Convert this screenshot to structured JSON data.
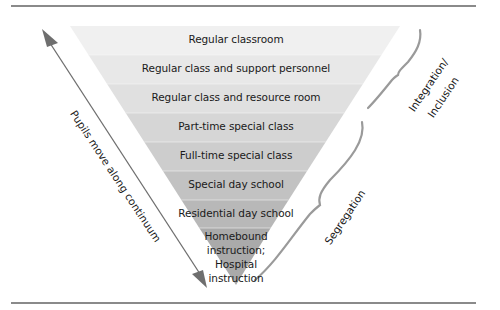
{
  "diagram": {
    "title": "",
    "bands": [
      {
        "label": "Regular classroom",
        "color": "#f0f0f0"
      },
      {
        "label": "Regular class and support personnel",
        "color": "#e8e8e8"
      },
      {
        "label": "Regular class and resource room",
        "color": "#e0e0e0"
      },
      {
        "label": "Part-time special class",
        "color": "#d6d6d6"
      },
      {
        "label": "Full-time special class",
        "color": "#cdcdcd"
      },
      {
        "label": "Special day school",
        "color": "#c2c2c2"
      },
      {
        "label": "Residential day school",
        "color": "#b8b8b8"
      },
      {
        "label_lines": [
          "Homebound",
          "instruction;",
          "Hospital",
          "instruction"
        ],
        "color": "#aaaaaa"
      }
    ],
    "arrow_label": "Pupils move along continuum",
    "brace_labels": {
      "integration_line1": "Integration/",
      "integration_line2": "Inclusion",
      "segregation": "Segregation"
    },
    "colors": {
      "rule": "#8a8a8a",
      "arrow": "#6e6e6e",
      "brace": "#9a9a9a",
      "text": "#1a1a1a"
    }
  }
}
